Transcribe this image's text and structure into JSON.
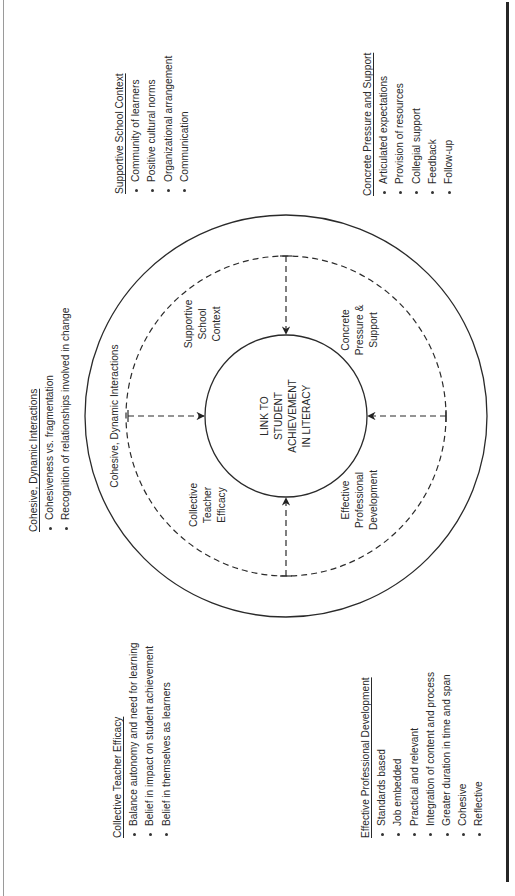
{
  "diagram": {
    "center_label": [
      "LINK TO",
      "STUDENT",
      "ACHIEVEMENT",
      "IN LITERACY"
    ],
    "ring_label": "Cohesive, Dynamic Interactions",
    "quadrants": {
      "supportive": [
        "Supportive",
        "School",
        "Context"
      ],
      "concrete": [
        "Concrete",
        "Pressure &",
        "Support"
      ],
      "collective": [
        "Collective",
        "Teacher",
        "Efficacy"
      ],
      "professional": [
        "Effective",
        "Professional",
        "Development"
      ]
    }
  },
  "lists": {
    "supportive_school_context": {
      "title": "Supportive School Context",
      "items": [
        "Community of learners",
        "Positive cultural norms",
        "Organizational arrangement",
        "Communication"
      ]
    },
    "concrete_pressure_support": {
      "title": "Concrete Pressure and Support",
      "items": [
        "Articulated expectations",
        "Provision of resources",
        "Collegial support",
        "Feedback",
        "Follow-up"
      ]
    },
    "cohesive_dynamic_interactions": {
      "title": "Cohesive, Dynamic Interactions",
      "items": [
        "Cohesiveness vs. fragmentation",
        "Recognition of relationships involved in change"
      ]
    },
    "collective_teacher_efficacy": {
      "title": "Collective Teacher Efficacy",
      "items": [
        "Balance autonomy and need for learning",
        "Belief in impact on student achievement",
        "Belief in themselves as learners"
      ]
    },
    "effective_professional_development": {
      "title": "Effective Professional Development",
      "items": [
        "Standards based",
        "Job embedded",
        "Practical and relevant",
        "Integration of content and process",
        "Greater duration in time and span",
        "Cohesive",
        "Reflective"
      ]
    }
  }
}
